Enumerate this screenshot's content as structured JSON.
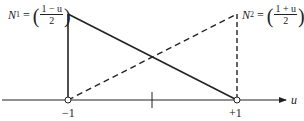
{
  "labels": {
    "n1": {
      "name": "N",
      "sub": "1",
      "eq": "=",
      "num": "1 − u",
      "den": "2"
    },
    "n2": {
      "name": "N",
      "sub": "2",
      "eq": "=",
      "num": "1 + u",
      "den": "2"
    },
    "axis": "u",
    "tick_left": "−1",
    "tick_right": "+1"
  },
  "colors": {
    "line": "#222222"
  }
}
